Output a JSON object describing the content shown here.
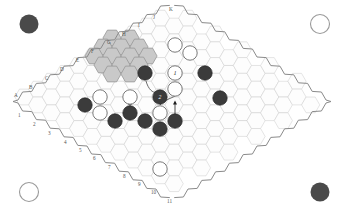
{
  "diagram": {
    "board_shape": "rhombus-hex-grid",
    "background_color": "#ffffff",
    "grid_line_color": "#cfcfcf",
    "outline_color": "#8a8a8a",
    "highlight_color": "#c9c9c9",
    "dark_piece_color": "#3b3b3b",
    "light_piece_color": "#ffffff"
  },
  "edge_labels": {
    "letters": [
      {
        "text": "A",
        "x": 14,
        "y": 97
      },
      {
        "text": "B",
        "x": 29,
        "y": 89
      },
      {
        "text": "C",
        "x": 45,
        "y": 80
      },
      {
        "text": "D",
        "x": 60,
        "y": 71
      },
      {
        "text": "E",
        "x": 76,
        "y": 62
      },
      {
        "text": "F",
        "x": 91,
        "y": 53
      },
      {
        "text": "G",
        "x": 107,
        "y": 44
      },
      {
        "text": "H",
        "x": 122,
        "y": 36
      },
      {
        "text": "I",
        "x": 138,
        "y": 27
      },
      {
        "text": "J",
        "x": 153,
        "y": 19
      },
      {
        "text": "K",
        "x": 169,
        "y": 11
      }
    ],
    "numbers": [
      {
        "text": "1",
        "x": 18,
        "y": 117
      },
      {
        "text": "2",
        "x": 33,
        "y": 126
      },
      {
        "text": "3",
        "x": 48,
        "y": 135
      },
      {
        "text": "4",
        "x": 64,
        "y": 144
      },
      {
        "text": "5",
        "x": 79,
        "y": 152
      },
      {
        "text": "6",
        "x": 93,
        "y": 160
      },
      {
        "text": "7",
        "x": 108,
        "y": 169
      },
      {
        "text": "8",
        "x": 123,
        "y": 178
      },
      {
        "text": "9",
        "x": 138,
        "y": 186
      },
      {
        "text": "10",
        "x": 151,
        "y": 194
      },
      {
        "text": "11",
        "x": 167,
        "y": 203
      }
    ]
  },
  "corner_markers": [
    {
      "name": "top-left-corner-marker",
      "type": "dark",
      "cx": 29,
      "cy": 24,
      "r": 9.5
    },
    {
      "name": "top-right-corner-marker",
      "type": "light",
      "cx": 320,
      "cy": 24,
      "r": 9.5
    },
    {
      "name": "bottom-left-corner-marker",
      "type": "light",
      "cx": 29,
      "cy": 192,
      "r": 9.5
    },
    {
      "name": "bottom-right-corner-marker",
      "type": "dark",
      "cx": 320,
      "cy": 192,
      "r": 9.5
    }
  ],
  "highlighted_cells": [
    [
      5,
      1
    ],
    [
      6,
      1
    ],
    [
      7,
      1
    ],
    [
      4,
      2
    ],
    [
      5,
      2
    ],
    [
      6,
      2
    ],
    [
      7,
      2
    ],
    [
      3,
      3
    ],
    [
      4,
      3
    ],
    [
      5,
      3
    ],
    [
      6,
      3
    ],
    [
      4,
      4
    ],
    [
      5,
      4
    ]
  ],
  "pieces": [
    {
      "name": "dark-piece",
      "color": "dark",
      "cx": 145,
      "cy": 73,
      "r": 7.2,
      "label": ""
    },
    {
      "name": "light-piece-1",
      "color": "light",
      "cx": 175,
      "cy": 73,
      "r": 7.2,
      "label": "1"
    },
    {
      "name": "dark-piece",
      "color": "dark",
      "cx": 205,
      "cy": 73,
      "r": 7.2,
      "label": ""
    },
    {
      "name": "light-piece",
      "color": "light",
      "cx": 175,
      "cy": 45,
      "r": 7.2,
      "label": ""
    },
    {
      "name": "light-piece",
      "color": "light",
      "cx": 190,
      "cy": 53,
      "r": 7.2,
      "label": ""
    },
    {
      "name": "light-piece",
      "color": "light",
      "cx": 175,
      "cy": 89,
      "r": 7.2,
      "label": ""
    },
    {
      "name": "dark-piece-2",
      "color": "dark",
      "cx": 160,
      "cy": 97,
      "r": 7.2,
      "label": "2"
    },
    {
      "name": "dark-piece",
      "color": "dark",
      "cx": 220,
      "cy": 98,
      "r": 7.2,
      "label": ""
    },
    {
      "name": "light-piece",
      "color": "light",
      "cx": 100,
      "cy": 97,
      "r": 7.2,
      "label": ""
    },
    {
      "name": "light-piece",
      "color": "light",
      "cx": 130,
      "cy": 97,
      "r": 7.2,
      "label": ""
    },
    {
      "name": "dark-piece",
      "color": "dark",
      "cx": 85,
      "cy": 105,
      "r": 7.2,
      "label": ""
    },
    {
      "name": "light-piece",
      "color": "light",
      "cx": 100,
      "cy": 113,
      "r": 7.2,
      "label": ""
    },
    {
      "name": "dark-piece",
      "color": "dark",
      "cx": 130,
      "cy": 113,
      "r": 7.2,
      "label": ""
    },
    {
      "name": "light-piece",
      "color": "light",
      "cx": 160,
      "cy": 113,
      "r": 7.2,
      "label": ""
    },
    {
      "name": "dark-piece",
      "color": "dark",
      "cx": 115,
      "cy": 121,
      "r": 7.2,
      "label": ""
    },
    {
      "name": "dark-piece",
      "color": "dark",
      "cx": 145,
      "cy": 121,
      "r": 7.2,
      "label": ""
    },
    {
      "name": "dark-piece",
      "color": "dark",
      "cx": 175,
      "cy": 121,
      "r": 7.2,
      "label": ""
    },
    {
      "name": "dark-piece",
      "color": "dark",
      "cx": 160,
      "cy": 129,
      "r": 7.2,
      "label": ""
    },
    {
      "name": "light-piece",
      "color": "light",
      "cx": 160,
      "cy": 169,
      "r": 7.2,
      "label": ""
    }
  ],
  "move_arrows": [
    {
      "name": "move-arrow-left",
      "x1": 130,
      "y1": 116,
      "x2": 130,
      "y2": 102
    },
    {
      "name": "move-arrow-right",
      "x1": 175,
      "y1": 116,
      "x2": 175,
      "y2": 102
    }
  ],
  "connector_curves": [
    {
      "name": "connector-curve-upper",
      "d": "M 146 81 C 149 92, 156 95, 159 90"
    },
    {
      "name": "connector-curve-lower",
      "d": "M 160 105 C 164 100, 172 98, 175 96"
    }
  ]
}
